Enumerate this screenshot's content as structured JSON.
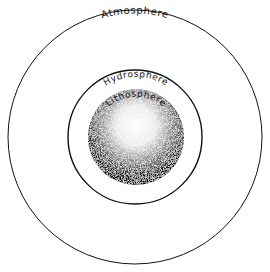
{
  "diagram": {
    "type": "concentric-spheres",
    "layers": [
      {
        "name": "Atmosphere",
        "label": "Atmosphere",
        "radius": 127
      },
      {
        "name": "Hydrosphere",
        "label": "Hydrosphere",
        "radius": 67
      },
      {
        "name": "Lithosphere",
        "label": "Lithosphere",
        "radius": 48
      }
    ],
    "colors": {
      "line": "#111111",
      "background": "#ffffff",
      "sphere_dark": "#000000"
    }
  }
}
